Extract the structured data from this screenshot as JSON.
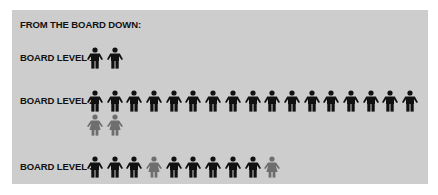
{
  "title": "FROM THE BOARD DOWN:",
  "colors": {
    "primary": "#111111",
    "secondary": "#6e6e6e"
  },
  "levels": [
    {
      "label": "BOARD LEVEL 1:",
      "rows": [
        [
          "male-dark",
          "male-dark"
        ]
      ]
    },
    {
      "label": "BOARD LEVEL 2:",
      "rows": [
        [
          "male-dark",
          "male-dark",
          "male-dark",
          "male-dark",
          "male-dark",
          "male-dark",
          "male-dark",
          "male-dark",
          "male-dark",
          "male-dark",
          "male-dark",
          "male-dark",
          "male-dark",
          "male-dark",
          "male-dark",
          "male-dark",
          "male-dark"
        ],
        [
          "female-gray",
          "female-gray"
        ]
      ]
    },
    {
      "label": "BOARD LEVEL 3:",
      "rows": [
        [
          "male-dark",
          "male-dark",
          "male-dark",
          "female-gray",
          "male-dark",
          "male-dark",
          "male-dark",
          "male-dark",
          "male-dark",
          "female-gray"
        ]
      ]
    }
  ]
}
